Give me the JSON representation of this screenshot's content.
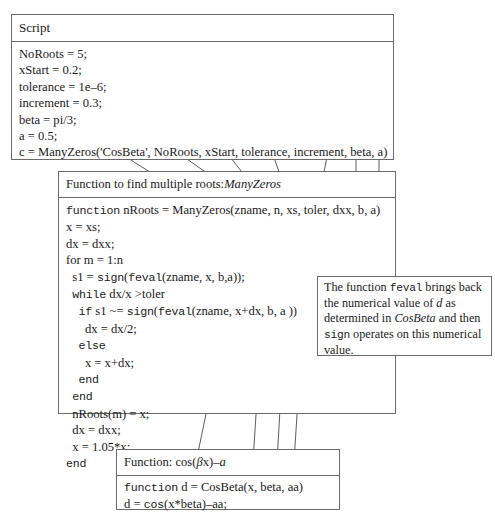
{
  "script_box": {
    "header": "Script",
    "lines": [
      [
        {
          "t": "NoRoots = 5;",
          "f": "serif"
        }
      ],
      [
        {
          "t": "xStart = 0.2;",
          "f": "serif"
        }
      ],
      [
        {
          "t": "tolerance = 1e–6;",
          "f": "serif"
        }
      ],
      [
        {
          "t": "increment = 0.3;",
          "f": "serif"
        }
      ],
      [
        {
          "t": "beta = pi/3;",
          "f": "serif"
        }
      ],
      [
        {
          "t": "a = 0.5;",
          "f": "serif"
        }
      ],
      [
        {
          "t": "c = ManyZeros('CosBeta', NoRoots, xStart, tolerance, increment, beta, a)",
          "f": "serif"
        }
      ]
    ]
  },
  "function_box": {
    "header_prefix": "Function to find multiple roots: ",
    "header_name": "ManyZeros",
    "lines": [
      [
        {
          "t": "function",
          "f": "mono"
        },
        {
          "t": " nRoots = ManyZeros(zname, n, xs, toler, dxx, b, a)",
          "f": "serif"
        }
      ],
      [
        {
          "t": "x = xs;",
          "f": "serif"
        }
      ],
      [
        {
          "t": "dx = dxx;",
          "f": "serif"
        }
      ],
      [
        {
          "t": "for m = 1:n",
          "f": "serif"
        }
      ],
      [
        {
          "t": "  s1 = ",
          "f": "serif"
        },
        {
          "t": "sign",
          "f": "mono"
        },
        {
          "t": "(",
          "f": "serif"
        },
        {
          "t": "feval",
          "f": "mono"
        },
        {
          "t": "(zname, x, b,a));",
          "f": "serif"
        }
      ],
      [
        {
          "t": "  ",
          "f": "serif"
        },
        {
          "t": "while",
          "f": "mono"
        },
        {
          "t": " dx/x >toler",
          "f": "serif"
        }
      ],
      [
        {
          "t": "    ",
          "f": "serif"
        },
        {
          "t": "if",
          "f": "mono"
        },
        {
          "t": " s1 ~= ",
          "f": "serif"
        },
        {
          "t": "sign",
          "f": "mono"
        },
        {
          "t": "(",
          "f": "serif"
        },
        {
          "t": "feval",
          "f": "mono"
        },
        {
          "t": "(zname, x+dx, b, a ))",
          "f": "serif"
        }
      ],
      [
        {
          "t": "      dx = dx/2;",
          "f": "serif"
        }
      ],
      [
        {
          "t": "    ",
          "f": "serif"
        },
        {
          "t": "else",
          "f": "mono"
        }
      ],
      [
        {
          "t": "      x = x+dx;",
          "f": "serif"
        }
      ],
      [
        {
          "t": "    ",
          "f": "serif"
        },
        {
          "t": "end",
          "f": "mono"
        }
      ],
      [
        {
          "t": "  ",
          "f": "serif"
        },
        {
          "t": "end",
          "f": "mono"
        }
      ],
      [
        {
          "t": "  nRoots(m) = x;",
          "f": "serif"
        }
      ],
      [
        {
          "t": "  dx = dxx;",
          "f": "serif"
        }
      ],
      [
        {
          "t": "  x = 1.05*x;",
          "f": "serif"
        }
      ],
      [
        {
          "t": "",
          "f": "serif"
        },
        {
          "t": "end",
          "f": "mono"
        }
      ]
    ]
  },
  "cosbeta_box": {
    "header_prefix": "Function: cos(",
    "header_beta": "β",
    "header_mid": "x)–",
    "header_a": "a",
    "lines": [
      [
        {
          "t": "function",
          "f": "mono"
        },
        {
          "t": " d = CosBeta(x, beta, aa)",
          "f": "serif"
        }
      ],
      [
        {
          "t": "d = ",
          "f": "serif"
        },
        {
          "t": "cos",
          "f": "mono"
        },
        {
          "t": "(x*beta)–aa;",
          "f": "serif"
        }
      ]
    ]
  },
  "note_box": {
    "segments": [
      {
        "t": "The function ",
        "f": "serif"
      },
      {
        "t": "feval",
        "f": "mono"
      },
      {
        "t": " brings back the numerical value of ",
        "f": "serif"
      },
      {
        "t": "d",
        "f": "italic"
      },
      {
        "t": " as determined in ",
        "f": "serif"
      },
      {
        "t": "CosBeta",
        "f": "italic"
      },
      {
        "t": " and then ",
        "f": "serif"
      },
      {
        "t": "sign",
        "f": "mono"
      },
      {
        "t": " operates on this numerical value.",
        "f": "serif"
      }
    ]
  },
  "colors": {
    "border": "#6b6b6b",
    "connector": "#4a4a4a",
    "arrowhead": "#2b2b2b",
    "text": "#1a1a1a",
    "background": "#ffffff"
  },
  "connectors": {
    "script_to_function": [
      {
        "from_label": "'CosBeta'",
        "to_label": "zname",
        "x1": 118,
        "y1": 152,
        "x2": 192,
        "y2": 201
      },
      {
        "from_label": "NoRoots",
        "to_label": "n",
        "x1": 177,
        "y1": 152,
        "x2": 243,
        "y2": 201
      },
      {
        "from_label": "xStart",
        "to_label": "xs",
        "x1": 226,
        "y1": 152,
        "x2": 264,
        "y2": 201
      },
      {
        "from_label": "tolerance",
        "to_label": "toler",
        "x1": 272,
        "y1": 152,
        "x2": 290,
        "y2": 201
      },
      {
        "from_label": "increment",
        "to_label": "dxx",
        "x1": 322,
        "y1": 152,
        "x2": 321,
        "y2": 201
      },
      {
        "from_label": "beta",
        "to_label": "b",
        "x1": 355,
        "y1": 152,
        "x2": 355,
        "y2": 201
      },
      {
        "from_label": "a",
        "to_label": "a",
        "x1": 378,
        "y1": 152,
        "x2": 378,
        "y2": 201
      }
    ],
    "feval_to_cosbeta": [
      {
        "from_label": "zname",
        "x1": 228,
        "y1": 305,
        "x2": 211,
        "y2": 466
      },
      {
        "from_label": "x+dx",
        "x1": 262,
        "y1": 305,
        "x2": 254,
        "y2": 466
      },
      {
        "from_label": "b",
        "x1": 285,
        "y1": 305,
        "x2": 279,
        "y2": 466
      },
      {
        "from_label": "a",
        "x1": 303,
        "y1": 305,
        "x2": 296,
        "y2": 466
      }
    ]
  }
}
